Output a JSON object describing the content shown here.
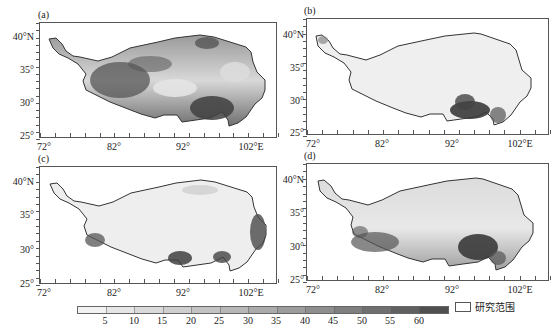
{
  "figure": {
    "panels": [
      {
        "id": "a",
        "label": "(a)"
      },
      {
        "id": "b",
        "label": "(b)"
      },
      {
        "id": "c",
        "label": "(c)"
      },
      {
        "id": "d",
        "label": "(d)"
      }
    ],
    "y_ticks": [
      "40°N",
      "35°",
      "30°",
      "25°"
    ],
    "x_ticks": [
      "72°",
      "82°",
      "92°",
      "102°E"
    ],
    "colorbar": {
      "labels": [
        "5",
        "10",
        "15",
        "20",
        "25",
        "30",
        "35",
        "40",
        "45",
        "50",
        "55",
        "60"
      ],
      "colors": [
        "#f2f2f2",
        "#e6e6e6",
        "#dadada",
        "#cfcfcf",
        "#c3c3c3",
        "#b7b7b7",
        "#ababab",
        "#9c9c9c",
        "#8e8e8e",
        "#7f7f7f",
        "#6f6f6f",
        "#606060",
        "#4f4f4f"
      ]
    },
    "legend": {
      "label": "研究范围"
    }
  },
  "chart_data": {
    "type": "heatmap",
    "title": "",
    "xlabel": "Longitude",
    "ylabel": "Latitude",
    "x_ticks": [
      "72°",
      "82°",
      "92°",
      "102°E"
    ],
    "y_ticks": [
      "25°",
      "30°",
      "35°",
      "40°N"
    ],
    "xlim": [
      72,
      106
    ],
    "ylim": [
      25,
      42
    ],
    "colorbar_levels": [
      5,
      10,
      15,
      20,
      25,
      30,
      35,
      40,
      45,
      50,
      55,
      60
    ],
    "legend": [
      "研究范围"
    ],
    "panels": [
      {
        "label": "(a)",
        "pattern": "high values (>50) along southern/western margin and southeast (~92–98°E, 28–31°N) and north-central (~84–88°E, 36–37°N, ~96°E 39°N); low values (~10–20) in central/east plateau"
      },
      {
        "label": "(b)",
        "pattern": "mostly low values (<10) across plateau; high values (>50) only in southeast (~92–98°E, 27–30°N)"
      },
      {
        "label": "(c)",
        "pattern": "mostly low values (<15); moderate-high (~40–55) along southwest edge, southeast (~92–93°E, 28°N; ~97°E, 28°N) and eastern margin (~102°E, 30–33°N)"
      },
      {
        "label": "(d)",
        "pattern": "low-moderate (~10–25) in north/central; high values (>50) along southwestern margin and southeast (~93–97°E, 28–31°N)"
      }
    ]
  }
}
